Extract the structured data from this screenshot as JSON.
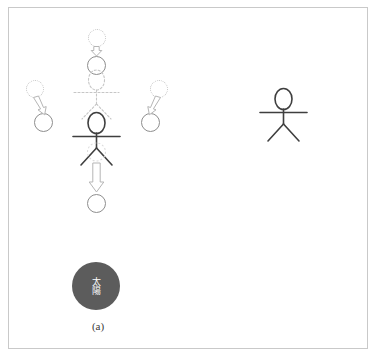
{
  "figure": {
    "title": "",
    "panels": [
      {
        "id": "a",
        "label": "(a)",
        "sun_label": "太陽",
        "description": "observer stick figure with dotted ghost posture and hollow block arrows showing circles moving away in four directions",
        "arrows": [
          {
            "name": "arrow-up",
            "direction": "down",
            "length": "short"
          },
          {
            "name": "arrow-left",
            "direction": "down-right",
            "length": "short"
          },
          {
            "name": "arrow-right",
            "direction": "down-left",
            "length": "short"
          },
          {
            "name": "arrow-bottom",
            "direction": "down",
            "length": "long"
          }
        ],
        "circles": [
          {
            "name": "circle-top-ghost",
            "style": "dotted"
          },
          {
            "name": "circle-top-solid",
            "style": "solid"
          },
          {
            "name": "circle-left-ghost",
            "style": "dotted"
          },
          {
            "name": "circle-left-solid",
            "style": "solid"
          },
          {
            "name": "circle-right-ghost",
            "style": "dotted"
          },
          {
            "name": "circle-right-solid",
            "style": "solid"
          },
          {
            "name": "circle-bottom-solid",
            "style": "solid"
          }
        ]
      },
      {
        "id": "b",
        "label": "(b)",
        "description": "observer stick figure with four overlapping circle pairs at top, left, right and bottom",
        "circles": [
          {
            "name": "circle-top-solid",
            "style": "solid"
          },
          {
            "name": "circle-top-ghost",
            "style": "dotted"
          },
          {
            "name": "circle-left-ghost",
            "style": "dotted"
          },
          {
            "name": "circle-left-solid",
            "style": "solid"
          },
          {
            "name": "circle-right-solid",
            "style": "solid"
          },
          {
            "name": "circle-right-ghost",
            "style": "dotted"
          },
          {
            "name": "circle-bottom-ghost",
            "style": "dotted"
          },
          {
            "name": "circle-bottom-solid",
            "style": "solid"
          }
        ]
      }
    ],
    "colors": {
      "stroke_solid": "#8e8e8e",
      "stroke_ghost": "#c2c2c2",
      "figure": "#444444",
      "sun_fill": "#5c5c5c",
      "sun_text": "#ffffff",
      "border": "#c9c9c9",
      "background": "#ffffff"
    }
  }
}
